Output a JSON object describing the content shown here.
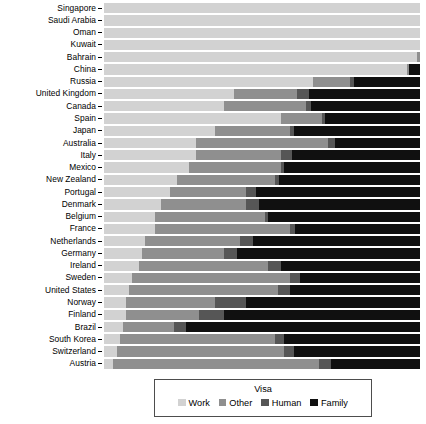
{
  "chart_data": {
    "type": "bar",
    "orientation": "horizontal",
    "stacked": true,
    "normalized": true,
    "title": "",
    "subtitle": "",
    "xlabel": "",
    "ylabel": "",
    "grid": false,
    "xlim": [
      0,
      100
    ],
    "xticks": [],
    "legend": {
      "title": "Visa",
      "position": "bottom",
      "entries": [
        {
          "name": "Work",
          "color": "#d2d2d2"
        },
        {
          "name": "Other",
          "color": "#8f8f8f"
        },
        {
          "name": "Human",
          "color": "#565656"
        },
        {
          "name": "Family",
          "color": "#101010"
        }
      ]
    },
    "series": [
      {
        "name": "Work",
        "color": "#d2d2d2"
      },
      {
        "name": "Other",
        "color": "#8f8f8f"
      },
      {
        "name": "Human",
        "color": "#565656"
      },
      {
        "name": "Family",
        "color": "#101010"
      }
    ],
    "categories": [
      "Singapore",
      "Saudi Arabia",
      "Oman",
      "Kuwait",
      "Bahrain",
      "China",
      "Russia",
      "United Kingdom",
      "Canada",
      "Spain",
      "Japan",
      "Australia",
      "Italy",
      "Mexico",
      "New Zealand",
      "Portugal",
      "Denmark",
      "Belgium",
      "France",
      "Netherlands",
      "Germany",
      "Ireland",
      "Sweden",
      "United States",
      "Norway",
      "Finland",
      "Brazil",
      "South Korea",
      "Switzerland",
      "Austria"
    ],
    "rows": [
      {
        "category": "Singapore",
        "Work": 100.0,
        "Other": 0.0,
        "Human": 0.0,
        "Family": 0.0
      },
      {
        "category": "Saudi Arabia",
        "Work": 100.0,
        "Other": 0.0,
        "Human": 0.0,
        "Family": 0.0
      },
      {
        "category": "Oman",
        "Work": 100.0,
        "Other": 0.0,
        "Human": 0.0,
        "Family": 0.0
      },
      {
        "category": "Kuwait",
        "Work": 100.0,
        "Other": 0.0,
        "Human": 0.0,
        "Family": 0.0
      },
      {
        "category": "Bahrain",
        "Work": 99.0,
        "Other": 1.0,
        "Human": 0.0,
        "Family": 0.0
      },
      {
        "category": "China",
        "Work": 96.0,
        "Other": 0.5,
        "Human": 0.0,
        "Family": 3.5
      },
      {
        "category": "Russia",
        "Work": 66.0,
        "Other": 12.0,
        "Human": 1.0,
        "Family": 21.0
      },
      {
        "category": "United Kingdom",
        "Work": 41.0,
        "Other": 20.0,
        "Human": 4.0,
        "Family": 35.0
      },
      {
        "category": "Canada",
        "Work": 38.0,
        "Other": 26.0,
        "Human": 1.5,
        "Family": 34.5
      },
      {
        "category": "Spain",
        "Work": 56.0,
        "Other": 13.0,
        "Human": 1.0,
        "Family": 30.0
      },
      {
        "category": "Japan",
        "Work": 35.0,
        "Other": 24.0,
        "Human": 1.0,
        "Family": 40.0
      },
      {
        "category": "Australia",
        "Work": 29.0,
        "Other": 42.0,
        "Human": 2.0,
        "Family": 27.0
      },
      {
        "category": "Italy",
        "Work": 29.0,
        "Other": 27.0,
        "Human": 3.5,
        "Family": 40.5
      },
      {
        "category": "Mexico",
        "Work": 27.0,
        "Other": 29.0,
        "Human": 1.0,
        "Family": 43.0
      },
      {
        "category": "New Zealand",
        "Work": 23.0,
        "Other": 31.0,
        "Human": 1.5,
        "Family": 44.5
      },
      {
        "category": "Portugal",
        "Work": 21.0,
        "Other": 24.0,
        "Human": 3.0,
        "Family": 52.0
      },
      {
        "category": "Denmark",
        "Work": 18.0,
        "Other": 27.0,
        "Human": 4.0,
        "Family": 51.0
      },
      {
        "category": "Belgium",
        "Work": 16.0,
        "Other": 35.0,
        "Human": 1.0,
        "Family": 48.0
      },
      {
        "category": "France",
        "Work": 16.0,
        "Other": 43.0,
        "Human": 1.5,
        "Family": 39.5
      },
      {
        "category": "Netherlands",
        "Work": 13.0,
        "Other": 30.0,
        "Human": 4.0,
        "Family": 53.0
      },
      {
        "category": "Germany",
        "Work": 12.0,
        "Other": 26.0,
        "Human": 4.0,
        "Family": 58.0
      },
      {
        "category": "Ireland",
        "Work": 11.0,
        "Other": 41.0,
        "Human": 4.0,
        "Family": 44.0
      },
      {
        "category": "Sweden",
        "Work": 9.0,
        "Other": 50.0,
        "Human": 3.0,
        "Family": 38.0
      },
      {
        "category": "United States",
        "Work": 8.0,
        "Other": 47.0,
        "Human": 4.0,
        "Family": 41.0
      },
      {
        "category": "Norway",
        "Work": 7.0,
        "Other": 28.0,
        "Human": 10.0,
        "Family": 55.0
      },
      {
        "category": "Finland",
        "Work": 7.0,
        "Other": 23.0,
        "Human": 8.0,
        "Family": 62.0
      },
      {
        "category": "Brazil",
        "Work": 6.0,
        "Other": 16.0,
        "Human": 4.0,
        "Family": 74.0
      },
      {
        "category": "South Korea",
        "Work": 5.0,
        "Other": 49.0,
        "Human": 3.0,
        "Family": 43.0
      },
      {
        "category": "Switzerland",
        "Work": 4.0,
        "Other": 53.0,
        "Human": 3.0,
        "Family": 40.0
      },
      {
        "category": "Austria",
        "Work": 3.0,
        "Other": 65.0,
        "Human": 4.0,
        "Family": 28.0
      }
    ]
  }
}
